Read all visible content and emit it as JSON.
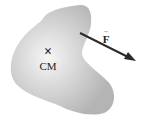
{
  "diagram": {
    "body": {
      "shape": "irregular-blob",
      "fill_center": "#f4f4f4",
      "fill_edge": "#b5b5b5"
    },
    "center_of_mass": {
      "marker": "×",
      "label": "CM"
    },
    "force": {
      "symbol": "F",
      "vector_mark": "→",
      "color": "#2b2b2b"
    }
  }
}
